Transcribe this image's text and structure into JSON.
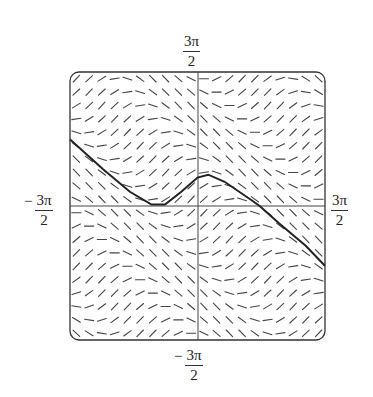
{
  "chart_data": {
    "type": "line",
    "title": "",
    "subtitle": "Slope field with solution curve",
    "xlabel": "",
    "ylabel": "",
    "xlim": [
      -4.712,
      4.712
    ],
    "ylim": [
      -4.712,
      4.712
    ],
    "tick_labels": {
      "x_min": {
        "sign": "−",
        "num": "3π",
        "den": "2"
      },
      "x_max": {
        "sign": "",
        "num": "3π",
        "den": "2"
      },
      "y_max": {
        "sign": "",
        "num": "3π",
        "den": "2"
      },
      "y_min": {
        "sign": "−",
        "num": "3π",
        "den": "2"
      }
    },
    "grid": false,
    "legend": null,
    "slope_field": {
      "equation": "dy/dx = cos(x + y)",
      "grid_n": 20
    },
    "series": [
      {
        "name": "solution curve",
        "x": [
          -4.71,
          -3.5,
          -2.5,
          -1.7,
          -1.2,
          -0.6,
          0.0,
          0.4,
          1.0,
          2.0,
          2.3,
          3.0,
          4.0,
          4.71
        ],
        "y": [
          2.34,
          1.3,
          0.5,
          0.05,
          0.05,
          0.5,
          1.0,
          1.1,
          0.85,
          0.2,
          0.0,
          -0.6,
          -1.4,
          -2.1
        ]
      }
    ]
  }
}
